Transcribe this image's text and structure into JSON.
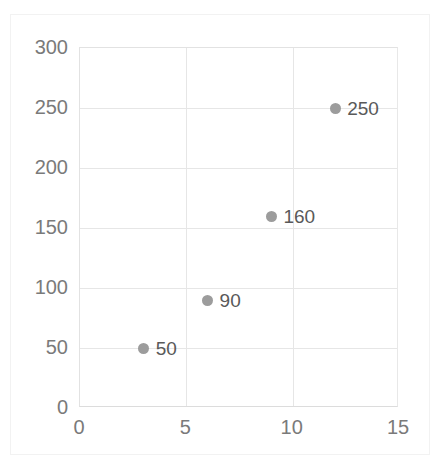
{
  "chart_data": {
    "type": "scatter",
    "title": "",
    "xlabel": "",
    "ylabel": "",
    "xlim": [
      0,
      15
    ],
    "ylim": [
      0,
      300
    ],
    "grid": true,
    "legend": false,
    "marker_color": "#9c9c9c",
    "label_color": "#595959",
    "tick_color": "#7a7a7a",
    "gridline_color": "#e6e6e6",
    "background_color": "#ffffff",
    "x_ticks": [
      0,
      5,
      10,
      15
    ],
    "y_ticks": [
      0,
      50,
      100,
      150,
      200,
      250,
      300
    ],
    "x_tick_labels": [
      "0",
      "5",
      "10",
      "15"
    ],
    "y_tick_labels": [
      "0",
      "50",
      "100",
      "150",
      "200",
      "250",
      "300"
    ],
    "points": [
      {
        "x": 3,
        "y": 50,
        "label": "50"
      },
      {
        "x": 6,
        "y": 90,
        "label": "90"
      },
      {
        "x": 9,
        "y": 160,
        "label": "160"
      },
      {
        "x": 12,
        "y": 250,
        "label": "250"
      }
    ]
  }
}
